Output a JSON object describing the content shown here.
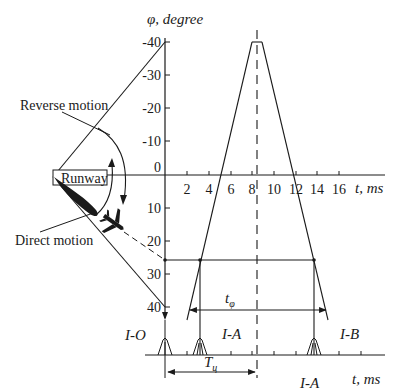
{
  "diagram": {
    "y_axis_label": "φ, degree",
    "x_axis_label": "t, ms",
    "x_axis_label_bottom": "t, ms",
    "y_ticks": [
      "-40",
      "-30",
      "-20",
      "-10",
      "0",
      "10",
      "20",
      "30",
      "40"
    ],
    "x_ticks": [
      "2",
      "4",
      "6",
      "8",
      "10",
      "12",
      "14",
      "16"
    ],
    "labels": {
      "reverse_motion": "Reverse motion",
      "direct_motion": "Direct motion",
      "runway": "Runway",
      "t_phi": "t",
      "t_phi_sub": "φ",
      "T_c": "T",
      "T_c_sub": "ц",
      "io": "I-O",
      "ia_top": "I-A",
      "ib": "I-B",
      "ia_bottom": "I-A"
    },
    "colors": {
      "line": "#1a1a1a",
      "background": "#ffffff"
    }
  }
}
